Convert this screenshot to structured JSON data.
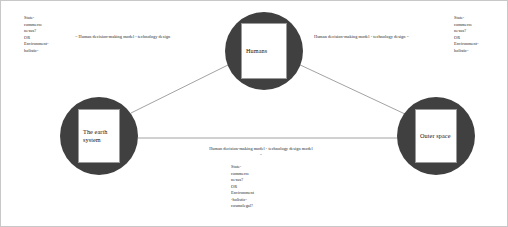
{
  "diagram": {
    "accent_color": "#404040",
    "edge_color": "#8a8a8a",
    "background": "#ffffff",
    "nodes": [
      {
        "id": "earth",
        "label": "The earth\nsystem",
        "cx": 98,
        "cy": 135,
        "r": 39
      },
      {
        "id": "humans",
        "label": "Humans",
        "cx": 263,
        "cy": 50,
        "r": 39
      },
      {
        "id": "outer",
        "label": "Outer\nspace",
        "cx": 435,
        "cy": 135,
        "r": 39
      }
    ],
    "edges": [
      {
        "id": "earth-humans",
        "from": "earth",
        "to": "humans"
      },
      {
        "id": "humans-outer",
        "from": "humans",
        "to": "outer"
      },
      {
        "id": "earth-outer",
        "from": "earth",
        "to": "outer"
      }
    ],
    "edge_labels": {
      "earth_humans": "= Human decision-making model - technology design",
      "humans_outer": "Human decision-making model - technology design =",
      "earth_outer": "Human decision-making model - technology design model\n="
    },
    "annotations": {
      "top_left": "State-\ncommerce\nnexus?\nOR\nEnvironment-\nholistic-",
      "top_right": "State-\ncommerce\nnexus?\nOR\nEnvironment-\nholistic-",
      "bottom_center": "State-\ncommerce\nnexus?\nOR\nEnvironment\n-holistic-\ncosmolegal?"
    }
  }
}
